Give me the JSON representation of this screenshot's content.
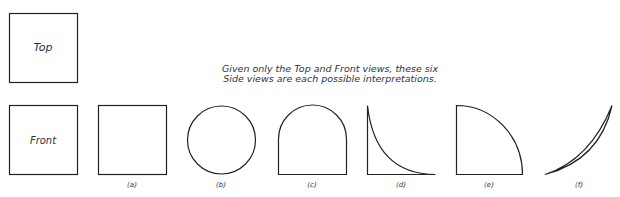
{
  "views": {
    "top_label": "Top",
    "front_label": "Front"
  },
  "caption": {
    "line1": "Given only the Top and Front views, these six",
    "line2": "Side views are each possible interpretations."
  },
  "side_views": [
    {
      "label": "(a)",
      "shape": "square"
    },
    {
      "label": "(b)",
      "shape": "circle"
    },
    {
      "label": "(c)",
      "shape": "arch"
    },
    {
      "label": "(d)",
      "shape": "concave-quarter"
    },
    {
      "label": "(e)",
      "shape": "quarter-circle"
    },
    {
      "label": "(f)",
      "shape": "crescent"
    }
  ],
  "colors": {
    "stroke": "#222222",
    "background": "#ffffff"
  }
}
